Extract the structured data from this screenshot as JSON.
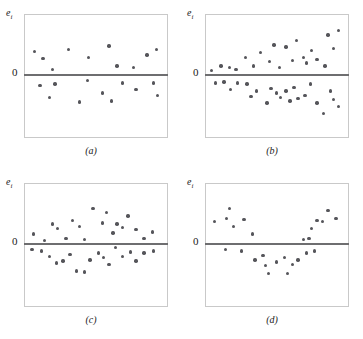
{
  "figure": {
    "background": "#ffffff",
    "dot_color": "#55555a",
    "baseline_color": "#6e6e70",
    "frame_color": "#c9c9c9"
  },
  "labels": {
    "e": "e",
    "e_subscript": "i",
    "zero": "0"
  },
  "chart_data": [
    {
      "type": "scatter",
      "title": "(a)",
      "ylabel": "e_i",
      "xlabel": "",
      "baseline": 0,
      "grid": false,
      "legend": null,
      "xlim": [
        0,
        100
      ],
      "ylim": [
        -100,
        100
      ],
      "description": "Residuals randomly scattered in a horizontal band of constant width",
      "points": [
        [
          5,
          40
        ],
        [
          11,
          28
        ],
        [
          18,
          8
        ],
        [
          30,
          44
        ],
        [
          45,
          30
        ],
        [
          60,
          50
        ],
        [
          66,
          14
        ],
        [
          78,
          12
        ],
        [
          88,
          34
        ],
        [
          95,
          44
        ],
        [
          9,
          -20
        ],
        [
          16,
          -42
        ],
        [
          20,
          -18
        ],
        [
          38,
          -50
        ],
        [
          44,
          -12
        ],
        [
          55,
          -34
        ],
        [
          62,
          -48
        ],
        [
          70,
          -16
        ],
        [
          80,
          -28
        ],
        [
          93,
          -16
        ],
        [
          96,
          -38
        ]
      ]
    },
    {
      "type": "scatter",
      "title": "(b)",
      "ylabel": "e_i",
      "xlabel": "",
      "baseline": 0,
      "grid": false,
      "legend": null,
      "xlim": [
        0,
        100
      ],
      "ylim": [
        -100,
        100
      ],
      "description": "Megaphone / fan pattern: residual spread increases with x (non-constant variance)",
      "points": [
        [
          2,
          6
        ],
        [
          9,
          14
        ],
        [
          15,
          12
        ],
        [
          20,
          8
        ],
        [
          27,
          30
        ],
        [
          33,
          14
        ],
        [
          38,
          38
        ],
        [
          45,
          22
        ],
        [
          48,
          52
        ],
        [
          52,
          12
        ],
        [
          57,
          48
        ],
        [
          62,
          24
        ],
        [
          65,
          60
        ],
        [
          70,
          30
        ],
        [
          72,
          20
        ],
        [
          76,
          42
        ],
        [
          80,
          26
        ],
        [
          86,
          14
        ],
        [
          88,
          70
        ],
        [
          92,
          46
        ],
        [
          96,
          78
        ],
        [
          5,
          -16
        ],
        [
          11,
          -14
        ],
        [
          16,
          -28
        ],
        [
          21,
          -16
        ],
        [
          28,
          -18
        ],
        [
          31,
          -40
        ],
        [
          35,
          -30
        ],
        [
          43,
          -52
        ],
        [
          46,
          -26
        ],
        [
          50,
          -34
        ],
        [
          53,
          -42
        ],
        [
          57,
          -30
        ],
        [
          60,
          -48
        ],
        [
          63,
          -24
        ],
        [
          66,
          -44
        ],
        [
          71,
          -38
        ],
        [
          75,
          -18
        ],
        [
          80,
          -52
        ],
        [
          85,
          -70
        ],
        [
          90,
          -30
        ],
        [
          92,
          -46
        ],
        [
          96,
          -58
        ]
      ]
    },
    {
      "type": "scatter",
      "title": "(c)",
      "ylabel": "e_i",
      "xlabel": "",
      "baseline": 0,
      "grid": false,
      "legend": null,
      "xlim": [
        0,
        100
      ],
      "ylim": [
        -100,
        100
      ],
      "description": "Curved / bowed pattern: residuals arch upward in the middle then fall (model misspecification)",
      "points": [
        [
          4,
          16
        ],
        [
          12,
          4
        ],
        [
          18,
          34
        ],
        [
          22,
          26
        ],
        [
          28,
          8
        ],
        [
          33,
          40
        ],
        [
          38,
          30
        ],
        [
          42,
          6
        ],
        [
          48,
          62
        ],
        [
          55,
          36
        ],
        [
          58,
          54
        ],
        [
          63,
          18
        ],
        [
          66,
          34
        ],
        [
          70,
          28
        ],
        [
          74,
          48
        ],
        [
          80,
          24
        ],
        [
          86,
          8
        ],
        [
          92,
          20
        ],
        [
          3,
          -12
        ],
        [
          10,
          -14
        ],
        [
          16,
          -24
        ],
        [
          21,
          -36
        ],
        [
          26,
          -32
        ],
        [
          31,
          -20
        ],
        [
          36,
          -50
        ],
        [
          42,
          -52
        ],
        [
          46,
          -30
        ],
        [
          52,
          -18
        ],
        [
          56,
          -26
        ],
        [
          60,
          -38
        ],
        [
          65,
          -8
        ],
        [
          70,
          -24
        ],
        [
          76,
          -16
        ],
        [
          80,
          -32
        ],
        [
          86,
          -18
        ],
        [
          93,
          -14
        ]
      ]
    },
    {
      "type": "scatter",
      "title": "(d)",
      "ylabel": "e_i",
      "xlabel": "",
      "baseline": 0,
      "grid": false,
      "legend": null,
      "xlim": [
        0,
        100
      ],
      "ylim": [
        -100,
        100
      ],
      "description": "Double-bow pattern: spread is wide at the ends and narrow in the middle",
      "points": [
        [
          4,
          38
        ],
        [
          13,
          44
        ],
        [
          15,
          62
        ],
        [
          18,
          30
        ],
        [
          26,
          42
        ],
        [
          32,
          16
        ],
        [
          70,
          6
        ],
        [
          74,
          8
        ],
        [
          76,
          26
        ],
        [
          80,
          40
        ],
        [
          84,
          38
        ],
        [
          88,
          58
        ],
        [
          94,
          44
        ],
        [
          12,
          -12
        ],
        [
          24,
          -14
        ],
        [
          34,
          -30
        ],
        [
          40,
          -22
        ],
        [
          42,
          -40
        ],
        [
          44,
          -54
        ],
        [
          50,
          -34
        ],
        [
          56,
          -26
        ],
        [
          58,
          -54
        ],
        [
          62,
          -38
        ],
        [
          66,
          -30
        ],
        [
          72,
          -18
        ],
        [
          78,
          -14
        ]
      ]
    }
  ]
}
